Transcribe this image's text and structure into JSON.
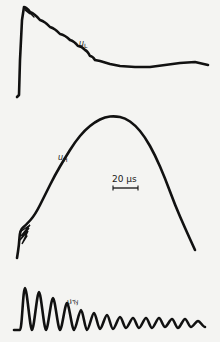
{
  "chart_data": [
    {
      "type": "line",
      "title": "",
      "series": [
        {
          "name": "u_L",
          "label_main": "u",
          "label_sub": "L",
          "description": "Fast rise to peak then decaying response with small ripples, settling to a slowly varying level",
          "points_px": [
            [
              17,
              97
            ],
            [
              19,
              95
            ],
            [
              20,
              60
            ],
            [
              22,
              20
            ],
            [
              24,
              7
            ],
            [
              30,
              12
            ],
            [
              40,
              20
            ],
            [
              50,
              27
            ],
            [
              60,
              34
            ],
            [
              70,
              40
            ],
            [
              78,
              46
            ],
            [
              85,
              50
            ],
            [
              90,
              56
            ],
            [
              95,
              60
            ],
            [
              100,
              61
            ],
            [
              110,
              64
            ],
            [
              120,
              66
            ],
            [
              135,
              67
            ],
            [
              150,
              67
            ],
            [
              165,
              65
            ],
            [
              180,
              63
            ],
            [
              195,
              62
            ],
            [
              208,
              65
            ]
          ]
        }
      ],
      "xlabel": "",
      "ylabel": "",
      "grid": false
    },
    {
      "type": "line",
      "title": "",
      "series": [
        {
          "name": "u_H",
          "label_main": "u",
          "label_sub": "H",
          "description": "Slow bell-shaped pulse with initial high-frequency noise near the start",
          "points_px": [
            [
              17,
              258
            ],
            [
              19,
              245
            ],
            [
              20,
              230
            ],
            [
              26,
              225
            ],
            [
              35,
              215
            ],
            [
              45,
              195
            ],
            [
              55,
              175
            ],
            [
              65,
              158
            ],
            [
              75,
              142
            ],
            [
              85,
              130
            ],
            [
              95,
              122
            ],
            [
              105,
              117
            ],
            [
              115,
              116
            ],
            [
              125,
              118
            ],
            [
              135,
              125
            ],
            [
              145,
              137
            ],
            [
              155,
              155
            ],
            [
              165,
              178
            ],
            [
              175,
              205
            ],
            [
              185,
              228
            ],
            [
              195,
              250
            ]
          ]
        }
      ],
      "scale_bar": {
        "label": "20 µs",
        "length_px": 25
      },
      "xlabel": "",
      "ylabel": "",
      "grid": false
    },
    {
      "type": "line",
      "title": "",
      "series": [
        {
          "name": "u_Ty",
          "label_main": "u",
          "label_sub": "Ty",
          "description": "Damped oscillation with decreasing amplitude, about 14 cycles",
          "baseline_y_px": 330,
          "peaks_px": [
            [
              25,
              288
            ],
            [
              39,
              292
            ],
            [
              53,
              298
            ],
            [
              67,
              303
            ],
            [
              81,
              310
            ],
            [
              94,
              313
            ],
            [
              107,
              315
            ],
            [
              120,
              317
            ],
            [
              133,
              318
            ],
            [
              146,
              318
            ],
            [
              159,
              318
            ],
            [
              172,
              319
            ],
            [
              185,
              319
            ],
            [
              198,
              321
            ]
          ],
          "troughs_px": [
            [
              32,
              330
            ],
            [
              46,
              330
            ],
            [
              60,
              330
            ],
            [
              74,
              330
            ],
            [
              87,
              330
            ],
            [
              100,
              329
            ],
            [
              113,
              329
            ],
            [
              126,
              328
            ],
            [
              139,
              328
            ],
            [
              152,
              328
            ],
            [
              165,
              327
            ],
            [
              178,
              328
            ],
            [
              191,
              327
            ],
            [
              205,
              327
            ]
          ]
        }
      ],
      "xlabel": "",
      "ylabel": "",
      "grid": false
    }
  ],
  "labels": {
    "u_L": {
      "main": "u",
      "sub": "L"
    },
    "u_H": {
      "main": "u",
      "sub": "H"
    },
    "u_Ty": {
      "main": "u",
      "sub": "Ty"
    },
    "scale": "20 µs"
  },
  "colors": {
    "background": "#f4f4f2",
    "trace": "#111111"
  }
}
